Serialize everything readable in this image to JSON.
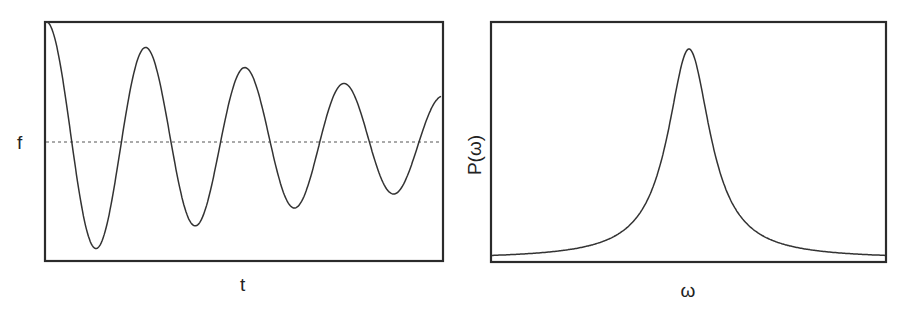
{
  "chart_data": [
    {
      "type": "line",
      "title": "",
      "xlabel": "t",
      "ylabel": "f",
      "grid": false,
      "legend": null,
      "description": "Damped oscillation about a dashed mean level",
      "reference_line": {
        "style": "dashed",
        "y": 0
      },
      "series": [
        {
          "name": "f(t)",
          "x": [
            0,
            0.12,
            0.25,
            0.37,
            0.5,
            0.62,
            0.75,
            0.87,
            1.0
          ],
          "values": [
            1.0,
            -0.88,
            0.79,
            -0.7,
            0.63,
            -0.55,
            0.5,
            -0.43,
            0.38
          ]
        }
      ],
      "ylim": [
        -1.05,
        1.0
      ],
      "xlim": [
        0,
        1
      ]
    },
    {
      "type": "line",
      "title": "",
      "xlabel": "ω",
      "ylabel": "P(ω)",
      "grid": false,
      "legend": null,
      "description": "Lorentzian-shaped power spectrum with a single central peak",
      "series": [
        {
          "name": "P(ω)",
          "x": [
            0,
            0.2,
            0.35,
            0.45,
            0.5,
            0.55,
            0.65,
            0.8,
            1.0
          ],
          "values": [
            0.02,
            0.06,
            0.18,
            0.55,
            1.0,
            0.55,
            0.18,
            0.06,
            0.02
          ]
        }
      ],
      "ylim": [
        0,
        1.1
      ],
      "xlim": [
        0,
        1
      ]
    }
  ],
  "labels": {
    "left_xlabel": "t",
    "left_ylabel": "f",
    "right_xlabel": "ω",
    "right_ylabel": "P(ω)"
  }
}
